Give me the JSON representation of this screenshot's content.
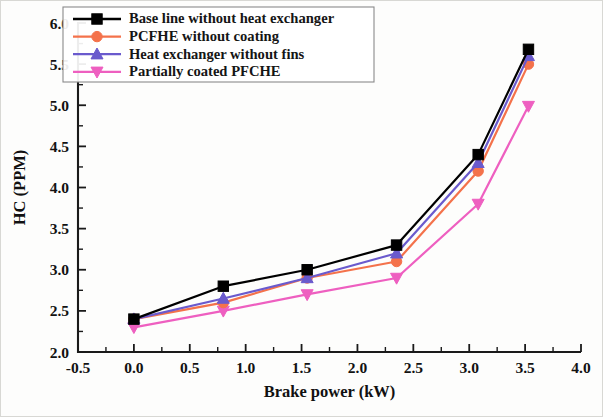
{
  "chart_data": {
    "type": "line",
    "title": "",
    "xlabel": "Brake power (kW)",
    "ylabel": "HC (PPM)",
    "xlim": [
      -0.5,
      4.0
    ],
    "ylim": [
      2.0,
      6.0
    ],
    "x_major_step": 0.5,
    "y_major_step": 0.5,
    "x_minor_per_major": 2,
    "y_minor_per_major": 2,
    "grid": false,
    "legend_position": "top-left",
    "x": [
      0.0,
      0.8,
      1.55,
      2.35,
      3.08,
      3.53
    ],
    "xticklabels": [
      "-0.5",
      "0.0",
      "0.5",
      "1.0",
      "1.5",
      "2.0",
      "2.5",
      "3.0",
      "3.5",
      "4.0"
    ],
    "yticklabels": [
      "2.0",
      "2.5",
      "3.0",
      "3.5",
      "4.0",
      "4.5",
      "5.0",
      "5.5",
      "6.0"
    ],
    "series": [
      {
        "name": "Base line without heat exchanger",
        "color": "#000000",
        "marker": "square",
        "values": [
          2.4,
          2.8,
          3.0,
          3.3,
          4.4,
          5.68
        ]
      },
      {
        "name": "PCFHE without coating",
        "color": "#F4724B",
        "marker": "circle",
        "values": [
          2.4,
          2.6,
          2.9,
          3.1,
          4.2,
          5.5
        ]
      },
      {
        "name": "Heat exchanger without fins",
        "color": "#6A5ACD",
        "marker": "triangle-up",
        "values": [
          2.4,
          2.65,
          2.9,
          3.2,
          4.3,
          5.6
        ]
      },
      {
        "name": "Partially coated PFCHE",
        "color": "#EE5FC0",
        "marker": "triangle-down",
        "values": [
          2.3,
          2.5,
          2.7,
          2.9,
          3.8,
          4.99
        ]
      }
    ]
  }
}
